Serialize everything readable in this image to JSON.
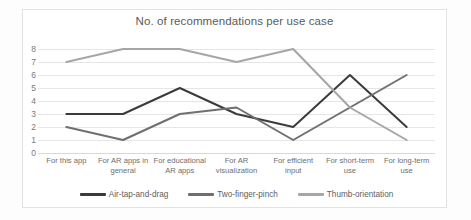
{
  "chart_data": {
    "type": "line",
    "title": "No. of recommendations per use case",
    "xlabel": "",
    "ylabel": "",
    "ylim": [
      0,
      8
    ],
    "yticks": [
      0,
      1,
      2,
      3,
      4,
      5,
      6,
      7,
      8
    ],
    "grid": true,
    "legend_position": "bottom",
    "categories": [
      "For this app",
      "For AR apps in general",
      "For educational AR apps",
      "For AR visualization",
      "For efficient input",
      "For short-term use",
      "For long-term use"
    ],
    "series": [
      {
        "name": "Air-tap-and-drag",
        "color": "#3b3b3b",
        "values": [
          3,
          3,
          5,
          3,
          2,
          6,
          2
        ]
      },
      {
        "name": "Two-finger-pinch",
        "color": "#6f6f6f",
        "values": [
          2,
          1,
          3,
          3.5,
          1,
          3.5,
          6
        ]
      },
      {
        "name": "Thumb-orientation",
        "color": "#a6a6a6",
        "values": [
          7,
          8,
          8,
          7,
          8,
          3.5,
          1
        ]
      }
    ]
  },
  "colors": {
    "background": "#ffffff",
    "frame": "#e2e2e2",
    "gridline": "#e6e6e6",
    "title_text": "#5a5a5a",
    "axis_text": "#7a7a7a"
  }
}
